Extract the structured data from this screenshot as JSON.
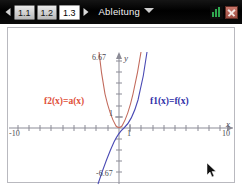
{
  "toolbar": {
    "prev_arrow_icon": "chevron-left-icon",
    "next_arrow_icon": "chevron-right-icon",
    "page_tabs": [
      {
        "label": "1.1",
        "active": false
      },
      {
        "label": "1.2",
        "active": false
      },
      {
        "label": "1.3",
        "active": true
      }
    ],
    "document_title": "Ableitung",
    "title_caret_icon": "chevron-down-icon",
    "status": {
      "battery_icon": "battery-icon",
      "close_icon": "close-icon"
    }
  },
  "graph": {
    "labels": {
      "y_max": "6.67",
      "y_min": "-6.67",
      "y_axis_name": "y",
      "x_axis_name": "x",
      "x_min": "-10",
      "x_max": "10",
      "x_unit": "1",
      "y_unit": "1"
    },
    "functions": [
      {
        "name": "f2-label",
        "text": "f2(x)=a(x)",
        "color": "#e0503a"
      },
      {
        "name": "f1-label",
        "text": "f1(x)=f(x)",
        "color": "#2f2fa8"
      }
    ],
    "window": {
      "xmin": -10,
      "xmax": 10,
      "ymin": -6.67,
      "ymax": 6.67
    },
    "cursor_icon": "mouse-pointer-icon"
  }
}
